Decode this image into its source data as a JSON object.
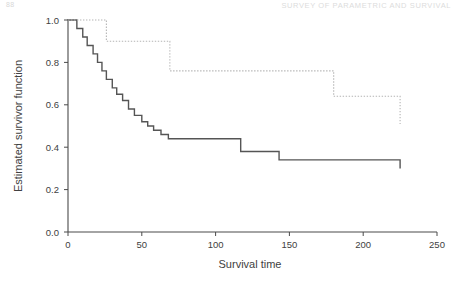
{
  "running_head": {
    "folio": "88",
    "title": "SURVEY OF PARAMETRIC AND SURVIVAL"
  },
  "chart_data": {
    "type": "line",
    "title": "",
    "subtitle": "",
    "xlabel": "Survival time",
    "ylabel": "Estimated survivor function",
    "xlim": [
      0,
      250
    ],
    "ylim": [
      0.0,
      1.0
    ],
    "xticks": [
      0,
      50,
      100,
      150,
      200,
      250
    ],
    "xtick_labels": [
      "0",
      "50",
      "100",
      "150",
      "200",
      "250"
    ],
    "yticks": [
      0.0,
      0.2,
      0.4,
      0.6,
      0.8,
      1.0
    ],
    "ytick_labels": [
      "0.0",
      "0.2",
      "0.4",
      "0.6",
      "0.8",
      "1.0"
    ],
    "grid": false,
    "legend_position": "none",
    "step_type": "post",
    "series": [
      {
        "name": "Group 1 (solid)",
        "style": "solid",
        "color": "#555555",
        "x": [
          0,
          6,
          10,
          13,
          17,
          20,
          23,
          26,
          30,
          33,
          37,
          41,
          45,
          50,
          54,
          58,
          63,
          68,
          72,
          111,
          117,
          143,
          225
        ],
        "y": [
          1.0,
          0.96,
          0.92,
          0.88,
          0.84,
          0.8,
          0.76,
          0.72,
          0.68,
          0.65,
          0.62,
          0.58,
          0.55,
          0.52,
          0.5,
          0.48,
          0.46,
          0.44,
          0.44,
          0.44,
          0.38,
          0.34,
          0.3
        ],
        "final_value": 0.3,
        "end_x": 225
      },
      {
        "name": "Group 2 (dotted)",
        "style": "dotted",
        "color": "#b4b4b4",
        "x": [
          0,
          24,
          26,
          57,
          69,
          145,
          180,
          225
        ],
        "y": [
          1.0,
          1.0,
          0.9,
          0.9,
          0.76,
          0.76,
          0.64,
          0.51
        ],
        "final_value": 0.51,
        "end_x": 225
      }
    ]
  }
}
